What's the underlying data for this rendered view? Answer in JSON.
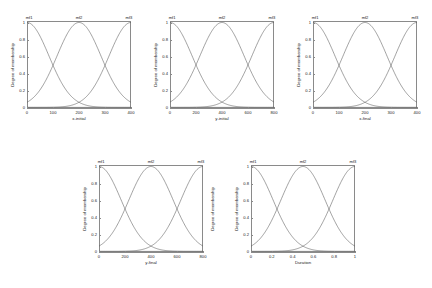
{
  "figure": {
    "background": "#ffffff",
    "axis_color": "#8a8a8a",
    "curve_color": "#555555",
    "text_color": "#222222",
    "rows": 2,
    "cols": 3
  },
  "common": {
    "ylabel": "Degree of membership",
    "yticks": [
      "1",
      "0.8",
      "0.6",
      "0.4",
      "0.2",
      "0"
    ],
    "mf_labels": [
      "mf1",
      "mf2",
      "mf3"
    ]
  },
  "panels": [
    {
      "id": "panel-x-initial",
      "xlabel": "x-initial",
      "xticks": [
        "0",
        "100",
        "200",
        "300",
        "400"
      ],
      "ylabel": "Degree of membership",
      "ylabel_side": "left",
      "mf_labels": [
        "mf1",
        "mf2",
        "mf3"
      ],
      "mf_label_positions": [
        0.02,
        0.5,
        0.98
      ]
    },
    {
      "id": "panel-y-initial",
      "xlabel": "y-initial",
      "xticks": [
        "0",
        "200",
        "400",
        "600",
        "800"
      ],
      "ylabel": "Degree of membership",
      "ylabel_side": "left",
      "mf_labels": [
        "mf1",
        "mf2",
        "mf3"
      ],
      "mf_label_positions": [
        0.02,
        0.5,
        0.98
      ]
    },
    {
      "id": "panel-x-final",
      "xlabel": "x-final",
      "xticks": [
        "0",
        "100",
        "200",
        "300",
        "400"
      ],
      "ylabel": "Degree of membership",
      "ylabel_side": "left",
      "mf_labels": [
        "mf1",
        "mf2",
        "mf3"
      ],
      "mf_label_positions": [
        0.02,
        0.5,
        0.98
      ]
    },
    {
      "id": "panel-y-final",
      "xlabel": "y-final",
      "xticks": [
        "0",
        "200",
        "400",
        "600",
        "800"
      ],
      "ylabel": "Degree of membership",
      "ylabel_side": "both",
      "mf_labels": [
        "mf1",
        "mf2",
        "mf3"
      ],
      "mf_label_positions": [
        0.02,
        0.5,
        0.98
      ]
    },
    {
      "id": "panel-duration",
      "xlabel": "Duration",
      "xticks": [
        "0",
        "0.2",
        "0.4",
        "0.6",
        "0.8",
        "1"
      ],
      "ylabel": "Degree of membership",
      "ylabel_side": "left",
      "mf_labels": [
        "mf1",
        "mf2",
        "mf3"
      ],
      "mf_label_positions": [
        0.02,
        0.5,
        0.98
      ]
    }
  ],
  "chart_data": {
    "type": "line",
    "title": "",
    "ylabel": "Degree of membership",
    "ylim": [
      0,
      1
    ],
    "yticks": [
      1,
      0.8,
      0.6,
      0.4,
      0.2,
      0
    ],
    "grid": false,
    "legend": "none (labels drawn above each curve peak)",
    "subplots": [
      {
        "xlabel": "x-initial",
        "xlim": [
          0,
          450
        ],
        "xticks": [
          0,
          100,
          200,
          300,
          400
        ],
        "series": [
          {
            "name": "mf1",
            "type": "gaussmf",
            "mean": 0,
            "sigma": 95,
            "peak_x": 0,
            "peak_y": 1
          },
          {
            "name": "mf2",
            "type": "gaussmf",
            "mean": 225,
            "sigma": 95,
            "peak_x": 225,
            "peak_y": 1
          },
          {
            "name": "mf3",
            "type": "gaussmf",
            "mean": 450,
            "sigma": 95,
            "peak_x": 450,
            "peak_y": 1
          }
        ],
        "crossover_points": [
          [
            112,
            0.35
          ],
          [
            337,
            0.35
          ]
        ]
      },
      {
        "xlabel": "y-initial",
        "xlim": [
          0,
          800
        ],
        "xticks": [
          0,
          200,
          400,
          600,
          800
        ],
        "series": [
          {
            "name": "mf1",
            "type": "gaussmf",
            "mean": 0,
            "sigma": 170,
            "peak_x": 0,
            "peak_y": 1
          },
          {
            "name": "mf2",
            "type": "gaussmf",
            "mean": 400,
            "sigma": 170,
            "peak_x": 400,
            "peak_y": 1
          },
          {
            "name": "mf3",
            "type": "gaussmf",
            "mean": 800,
            "sigma": 170,
            "peak_x": 800,
            "peak_y": 1
          }
        ],
        "crossover_points": [
          [
            200,
            0.35
          ],
          [
            600,
            0.35
          ]
        ]
      },
      {
        "xlabel": "x-final",
        "xlim": [
          0,
          450
        ],
        "xticks": [
          0,
          100,
          200,
          300,
          400
        ],
        "series": [
          {
            "name": "mf1",
            "type": "gaussmf",
            "mean": 0,
            "sigma": 95,
            "peak_x": 0,
            "peak_y": 1
          },
          {
            "name": "mf2",
            "type": "gaussmf",
            "mean": 225,
            "sigma": 95,
            "peak_x": 225,
            "peak_y": 1
          },
          {
            "name": "mf3",
            "type": "gaussmf",
            "mean": 450,
            "sigma": 95,
            "peak_x": 450,
            "peak_y": 1
          }
        ],
        "crossover_points": [
          [
            112,
            0.35
          ],
          [
            337,
            0.35
          ]
        ]
      },
      {
        "xlabel": "y-final",
        "xlim": [
          0,
          800
        ],
        "xticks": [
          0,
          200,
          400,
          600,
          800
        ],
        "series": [
          {
            "name": "mf1",
            "type": "gaussmf",
            "mean": 0,
            "sigma": 170,
            "peak_x": 0,
            "peak_y": 1
          },
          {
            "name": "mf2",
            "type": "gaussmf",
            "mean": 400,
            "sigma": 170,
            "peak_x": 400,
            "peak_y": 1
          },
          {
            "name": "mf3",
            "type": "gaussmf",
            "mean": 800,
            "sigma": 170,
            "peak_x": 800,
            "peak_y": 1
          }
        ],
        "crossover_points": [
          [
            200,
            0.35
          ],
          [
            600,
            0.35
          ]
        ]
      },
      {
        "xlabel": "Duration",
        "xlim": [
          0,
          1
        ],
        "xticks": [
          0,
          0.2,
          0.4,
          0.6,
          0.8,
          1
        ],
        "series": [
          {
            "name": "mf1",
            "type": "gaussmf",
            "mean": 0,
            "sigma": 0.212,
            "peak_x": 0,
            "peak_y": 1
          },
          {
            "name": "mf2",
            "type": "gaussmf",
            "mean": 0.5,
            "sigma": 0.212,
            "peak_x": 0.5,
            "peak_y": 1
          },
          {
            "name": "mf3",
            "type": "gaussmf",
            "mean": 1,
            "sigma": 0.212,
            "peak_x": 1,
            "peak_y": 1
          }
        ],
        "crossover_points": [
          [
            0.25,
            0.35
          ],
          [
            0.75,
            0.35
          ]
        ]
      }
    ]
  }
}
